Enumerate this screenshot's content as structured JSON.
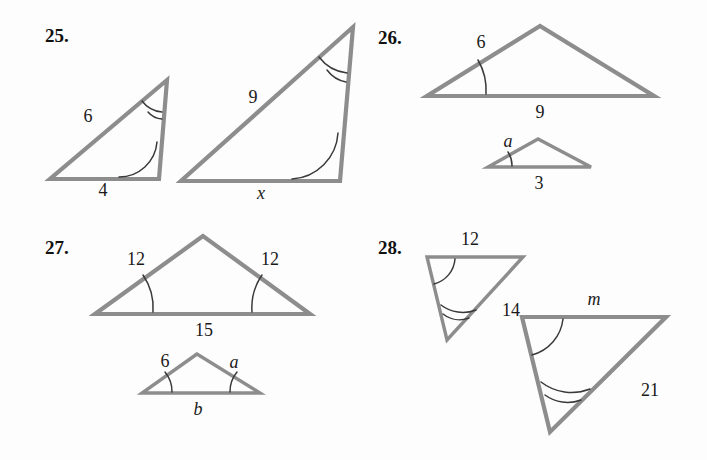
{
  "page": {
    "width": 707,
    "height": 460,
    "background": "#fdfdfd",
    "stroke_color": "#8d8d8d",
    "arc_color": "#3a3a3a",
    "text_color": "#1a1a1a"
  },
  "problems": [
    {
      "number": "25.",
      "figures": [
        {
          "name": "small-right-triangle",
          "labels": [
            {
              "text": "6",
              "kind": "number"
            },
            {
              "text": "4",
              "kind": "number"
            }
          ],
          "arc_marks": [
            {
              "at": "apex",
              "ticks": 2
            },
            {
              "at": "bottom-right",
              "ticks": 1
            }
          ]
        },
        {
          "name": "large-right-triangle",
          "labels": [
            {
              "text": "9",
              "kind": "number"
            },
            {
              "text": "x",
              "kind": "variable"
            }
          ],
          "arc_marks": [
            {
              "at": "apex",
              "ticks": 2
            },
            {
              "at": "bottom-right",
              "ticks": 1
            }
          ]
        }
      ]
    },
    {
      "number": "26.",
      "figures": [
        {
          "name": "large-obtuse-triangle",
          "labels": [
            {
              "text": "6",
              "kind": "number"
            },
            {
              "text": "9",
              "kind": "number"
            }
          ],
          "arc_marks": [
            {
              "at": "bottom-left",
              "ticks": 1
            }
          ]
        },
        {
          "name": "small-obtuse-triangle",
          "labels": [
            {
              "text": "a",
              "kind": "variable"
            },
            {
              "text": "3",
              "kind": "number"
            }
          ],
          "arc_marks": [
            {
              "at": "bottom-left",
              "ticks": 1
            }
          ]
        }
      ]
    },
    {
      "number": "27.",
      "figures": [
        {
          "name": "large-isosceles-triangle",
          "labels": [
            {
              "text": "12",
              "kind": "number"
            },
            {
              "text": "12",
              "kind": "number"
            },
            {
              "text": "15",
              "kind": "number"
            }
          ],
          "arc_marks": [
            {
              "at": "bottom-left",
              "ticks": 1
            },
            {
              "at": "bottom-right",
              "ticks": 1
            }
          ]
        },
        {
          "name": "small-isosceles-triangle",
          "labels": [
            {
              "text": "6",
              "kind": "number"
            },
            {
              "text": "a",
              "kind": "variable"
            },
            {
              "text": "b",
              "kind": "variable"
            }
          ],
          "arc_marks": [
            {
              "at": "bottom-left",
              "ticks": 1
            },
            {
              "at": "bottom-right",
              "ticks": 1
            }
          ]
        }
      ]
    },
    {
      "number": "28.",
      "figures": [
        {
          "name": "small-scalene-triangle",
          "labels": [
            {
              "text": "12",
              "kind": "number"
            },
            {
              "text": "14",
              "kind": "number"
            }
          ],
          "arc_marks": [
            {
              "at": "top-left",
              "ticks": 1
            },
            {
              "at": "bottom",
              "ticks": 2
            }
          ]
        },
        {
          "name": "large-scalene-triangle",
          "labels": [
            {
              "text": "m",
              "kind": "variable"
            },
            {
              "text": "21",
              "kind": "number"
            }
          ],
          "arc_marks": [
            {
              "at": "top-left",
              "ticks": 1
            },
            {
              "at": "bottom",
              "ticks": 2
            }
          ]
        }
      ]
    }
  ],
  "labels": {
    "p25_num": "25.",
    "p25_small_side_a": "6",
    "p25_small_base": "4",
    "p25_large_side_a": "9",
    "p25_large_base": "x",
    "p26_num": "26.",
    "p26_large_side": "6",
    "p26_large_base": "9",
    "p26_small_side": "a",
    "p26_small_base": "3",
    "p27_num": "27.",
    "p27_large_left": "12",
    "p27_large_right": "12",
    "p27_large_base": "15",
    "p27_small_left": "6",
    "p27_small_right": "a",
    "p27_small_base": "b",
    "p28_num": "28.",
    "p28_small_top": "12",
    "p28_small_right": "14",
    "p28_large_top": "m",
    "p28_large_right": "21"
  }
}
